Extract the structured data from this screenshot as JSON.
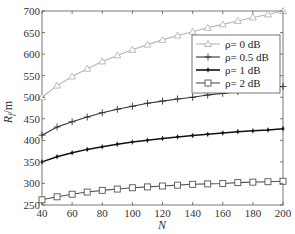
{
  "chart_data": {
    "type": "line",
    "title": "",
    "xlabel": "N",
    "ylabel": "R_f/m",
    "xlim": [
      40,
      200
    ],
    "ylim": [
      250,
      700
    ],
    "x_ticks": [
      40,
      60,
      80,
      100,
      120,
      140,
      160,
      180,
      200
    ],
    "y_ticks": [
      250,
      300,
      350,
      400,
      450,
      500,
      550,
      600,
      650,
      700
    ],
    "grid": false,
    "legend_position": "upper right (inside)",
    "x": [
      40,
      50,
      60,
      70,
      80,
      90,
      100,
      110,
      120,
      130,
      140,
      150,
      160,
      170,
      180,
      190,
      200
    ],
    "series": [
      {
        "name": "ρ= 0 dB",
        "marker": "triangle",
        "color": "#b4b4b4",
        "values": [
          500,
          527,
          548,
          566,
          583,
          597,
          610,
          622,
          633,
          643,
          652,
          661,
          669,
          677,
          685,
          692,
          700
        ]
      },
      {
        "name": "ρ= 0.5 dB",
        "marker": "plus",
        "color": "#333333",
        "values": [
          412,
          431,
          443,
          454,
          464,
          472,
          479,
          486,
          491,
          496,
          500,
          505,
          509,
          513,
          517,
          521,
          525
        ]
      },
      {
        "name": "ρ= 1 dB",
        "marker": "dot-plus",
        "color": "#111111",
        "values": [
          350,
          362,
          371,
          379,
          385,
          391,
          396,
          400,
          404,
          408,
          411,
          414,
          417,
          420,
          422,
          424,
          427
        ]
      },
      {
        "name": "ρ= 2 dB",
        "marker": "square",
        "color": "#555555",
        "values": [
          262,
          269,
          275,
          280,
          284,
          287,
          290,
          292,
          294,
          296,
          298,
          299,
          300,
          302,
          303,
          304,
          305
        ]
      }
    ]
  },
  "labels": {
    "xlabel": "N",
    "ylabel_main": "R",
    "ylabel_sub": "f",
    "ylabel_unit": "/m"
  }
}
